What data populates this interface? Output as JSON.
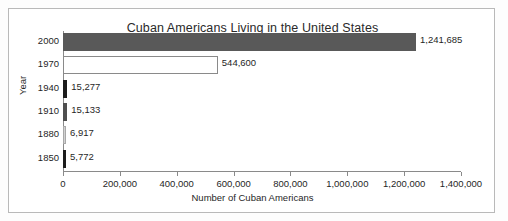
{
  "chart_data": {
    "type": "bar",
    "orientation": "horizontal",
    "title": "Cuban Americans Living in the United States",
    "xlabel": "Number of Cuban Americans",
    "ylabel": "Year",
    "categories": [
      "2000",
      "1970",
      "1940",
      "1910",
      "1880",
      "1850"
    ],
    "values": [
      1241685,
      544600,
      15277,
      15133,
      6917,
      5772
    ],
    "value_labels": [
      "1,241,685",
      "544,600",
      "15,277",
      "15,133",
      "6,917",
      "5,772"
    ],
    "bar_colors": [
      "#595959",
      "#ffffff",
      "#1c1c1c",
      "#4f4f4f",
      "#d2d2d2",
      "#1c1c1c"
    ],
    "bar_border_colors": [
      "#595959",
      "#8a8a8a",
      "#1c1c1c",
      "#4f4f4f",
      "#a8a8a8",
      "#1c1c1c"
    ],
    "xlim": [
      0,
      1400000
    ],
    "xticks": [
      0,
      200000,
      400000,
      600000,
      800000,
      1000000,
      1200000,
      1400000
    ],
    "xticklabels": [
      "0",
      "200,000",
      "400,000",
      "600,000",
      "800,000",
      "1,000,000",
      "1,200,000",
      "1,400,000"
    ],
    "grid": false,
    "legend": null,
    "frame_border_color": "#b9b9b9",
    "axis_color": "#8a8a8a",
    "text_color": "#1f1f1f"
  }
}
